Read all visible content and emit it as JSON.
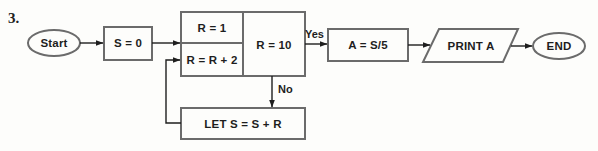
{
  "problem_number": "3.",
  "nodes": {
    "start": {
      "shape": "ellipse",
      "label": "Start"
    },
    "init_s": {
      "shape": "rectangle",
      "label": "S = 0"
    },
    "init_r": {
      "shape": "rectangle",
      "label": "R = 1"
    },
    "increment_r": {
      "shape": "rectangle",
      "label": "R = R + 2"
    },
    "test_r": {
      "shape": "rectangle",
      "label": "R = 10"
    },
    "compute_a": {
      "shape": "rectangle",
      "label": "A = S/5"
    },
    "print_a": {
      "shape": "parallelogram",
      "label": "PRINT A"
    },
    "end": {
      "shape": "ellipse",
      "label": "END"
    },
    "accumulate": {
      "shape": "rectangle",
      "label": "LET S = S + R"
    }
  },
  "edges": {
    "yes_label": "Yes",
    "no_label": "No",
    "list": [
      {
        "from": "start",
        "to": "init_s"
      },
      {
        "from": "init_s",
        "to": "init_r"
      },
      {
        "from": "test_r",
        "to": "compute_a",
        "label": "Yes"
      },
      {
        "from": "test_r",
        "to": "accumulate",
        "label": "No"
      },
      {
        "from": "accumulate",
        "to": "increment_r"
      },
      {
        "from": "compute_a",
        "to": "print_a"
      },
      {
        "from": "print_a",
        "to": "end"
      }
    ]
  },
  "colors": {
    "stroke": "#6b6b6b",
    "arrow": "#1e1e1e",
    "text": "#1e1e1e",
    "background": "#fdfdfb"
  }
}
